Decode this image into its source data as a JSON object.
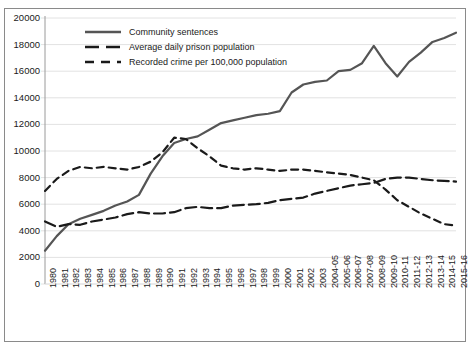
{
  "chart_data": {
    "type": "line",
    "title": "",
    "xlabel": "",
    "ylabel": "",
    "ylim": [
      0,
      20000
    ],
    "ytick_step": 2000,
    "grid": true,
    "legend_position": "top-left",
    "yticks": [
      "0",
      "2000",
      "4000",
      "6000",
      "8000",
      "10000",
      "12000",
      "14000",
      "16000",
      "18000",
      "20000"
    ],
    "categories": [
      "1980",
      "1981",
      "1982",
      "1983",
      "1984",
      "1985",
      "1986",
      "1987",
      "1988",
      "1989",
      "1990",
      "1991",
      "1992",
      "1993",
      "1994",
      "1995",
      "1996",
      "1997",
      "1998",
      "1999",
      "2000",
      "2001",
      "2002",
      "2003",
      "2004-05",
      "2005-06",
      "2006-07",
      "2007-08",
      "2008-09",
      "2009-10",
      "2010-11",
      "2011-12",
      "2012-13",
      "2013-14",
      "2014-15",
      "2015-16"
    ],
    "series": [
      {
        "name": "Community sentences",
        "style": "solid",
        "color": "#555555",
        "width": 2.2,
        "values": [
          2500,
          3600,
          4500,
          4900,
          5200,
          5500,
          5900,
          6200,
          6700,
          8300,
          9600,
          10600,
          10900,
          11100,
          11600,
          12100,
          12300,
          12500,
          12700,
          12800,
          13000,
          14400,
          15000,
          15200,
          15300,
          16000,
          16100,
          16600,
          17900,
          16600,
          15600,
          16700,
          17400,
          18200,
          18500,
          18900
        ]
      },
      {
        "name": "Average daily prison population",
        "style": "dashed-long",
        "color": "#1a1a1a",
        "width": 2.2,
        "values": [
          4700,
          4300,
          4500,
          4450,
          4700,
          4850,
          5000,
          5250,
          5400,
          5300,
          5300,
          5400,
          5700,
          5800,
          5700,
          5700,
          5900,
          5950,
          6000,
          6100,
          6300,
          6400,
          6500,
          6800,
          7000,
          7200,
          7400,
          7500,
          7600,
          7900,
          8000,
          8000,
          7900,
          7800,
          7750,
          7700
        ]
      },
      {
        "name": "Recorded crime per 100,000 population",
        "style": "dashed",
        "color": "#1a1a1a",
        "width": 2.2,
        "values": [
          7000,
          7900,
          8500,
          8800,
          8700,
          8800,
          8700,
          8600,
          8800,
          9200,
          9900,
          11000,
          10900,
          10200,
          9600,
          8900,
          8700,
          8600,
          8700,
          8600,
          8500,
          8600,
          8600,
          8500,
          8400,
          8300,
          8200,
          8000,
          7800,
          7100,
          6300,
          5800,
          5300,
          4900,
          4500,
          4400
        ]
      }
    ]
  }
}
